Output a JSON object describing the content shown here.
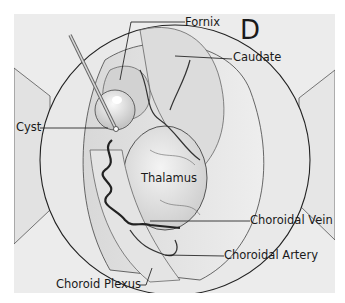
{
  "figure": {
    "panel_letter": "D",
    "labels": {
      "fornix": "Fornix",
      "caudate": "Caudate",
      "cyst": "Cyst",
      "thalamus": "Thalamus",
      "choroidal_vein": "Choroidal Vein",
      "choroidal_artery": "Choroidal Artery",
      "choroid_plexus": "Choroid Plexus"
    }
  }
}
